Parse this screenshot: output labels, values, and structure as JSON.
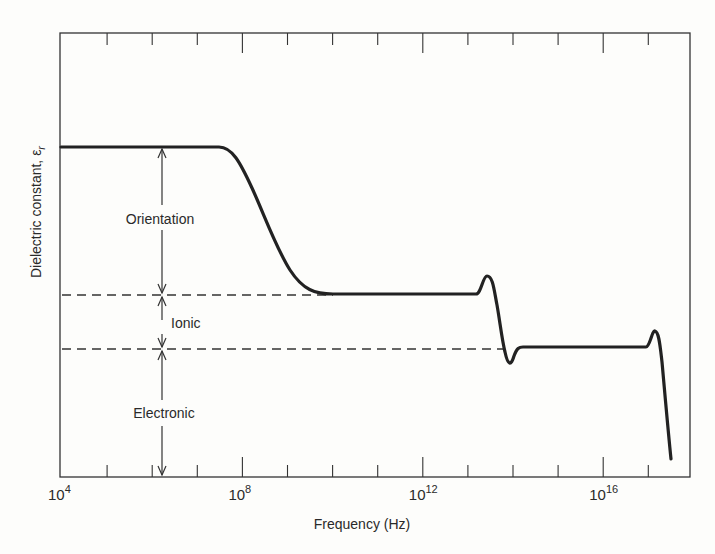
{
  "chart_data": {
    "type": "line",
    "title": "",
    "xlabel": "Frequency (Hz)",
    "ylabel": "Dielectric constant, εr",
    "ylabel_main": "Dielectric constant, ε",
    "ylabel_sub": "r",
    "xscale": "log",
    "xlim_exp": [
      4,
      18.5
    ],
    "x_ticks": [
      {
        "base": "10",
        "exp": "4",
        "value_exp": 4
      },
      {
        "base": "10",
        "exp": "8",
        "value_exp": 8
      },
      {
        "base": "10",
        "exp": "12",
        "value_exp": 12
      },
      {
        "base": "10",
        "exp": "16",
        "value_exp": 16
      }
    ],
    "y_ticks": [],
    "grid": false,
    "legend": null,
    "levels": {
      "total_low_freq": 3.0,
      "ionic_plus_electronic": 1.65,
      "electronic": 1.0
    },
    "regions": [
      {
        "name": "Orientation",
        "from": 1.65,
        "to": 3.0
      },
      {
        "name": "Ionic",
        "from": 1.0,
        "to": 1.65
      },
      {
        "name": "Electronic",
        "from": 0.0,
        "to": 1.0
      }
    ],
    "series": [
      {
        "name": "Dielectric constant",
        "x_exp": [
          4,
          7.6,
          8.0,
          8.5,
          9.0,
          9.5,
          10.0,
          10.5,
          13.0,
          13.2,
          13.45,
          13.7,
          13.9,
          14.05,
          14.3,
          14.5,
          17.0,
          17.2,
          17.4,
          17.6,
          17.85
        ],
        "y": [
          3.0,
          3.0,
          2.92,
          2.65,
          2.3,
          1.95,
          1.72,
          1.65,
          1.65,
          1.72,
          1.85,
          1.4,
          0.95,
          0.85,
          0.98,
          1.0,
          1.0,
          1.1,
          0.95,
          0.5,
          0.15
        ]
      }
    ],
    "annotations": [
      {
        "text": "Orientation",
        "type": "double-arrow",
        "x_exp": 6.25
      },
      {
        "text": "Ionic",
        "type": "double-arrow",
        "x_exp": 6.25
      },
      {
        "text": "Electronic",
        "type": "double-arrow",
        "x_exp": 6.25
      }
    ],
    "reference_lines": [
      {
        "style": "dashed",
        "y": 1.65,
        "x_exp_range": [
          4,
          10.5
        ]
      },
      {
        "style": "dashed",
        "y": 1.0,
        "x_exp_range": [
          4,
          14.0
        ]
      }
    ]
  }
}
